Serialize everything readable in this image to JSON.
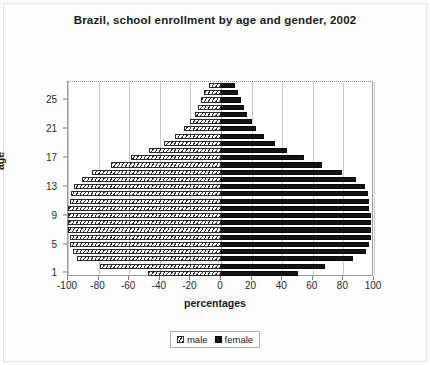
{
  "chart_data": {
    "type": "bar",
    "subtype": "population-pyramid",
    "title": "Brazil, school enrollment by age and gender, 2002",
    "xlabel": "percentages",
    "ylabel": "age",
    "xlim": [
      -100,
      100
    ],
    "xticks": [
      -100,
      -80,
      -60,
      -40,
      -20,
      0,
      20,
      40,
      60,
      80,
      100
    ],
    "xticklabels": [
      "-100",
      "-80",
      "-60",
      "-40",
      "-20",
      "0",
      "20",
      "40",
      "60",
      "80",
      "100"
    ],
    "ylim": [
      0,
      28
    ],
    "yticks": [
      1,
      5,
      9,
      13,
      17,
      21,
      25
    ],
    "yticklabels": [
      "1",
      "5",
      "9",
      "13",
      "17",
      "21",
      "25"
    ],
    "grid": "vertical",
    "legend_position": "bottom-center",
    "categories": [
      1,
      2,
      3,
      4,
      5,
      6,
      7,
      8,
      9,
      10,
      11,
      12,
      13,
      14,
      15,
      16,
      17,
      18,
      19,
      20,
      21,
      22,
      23,
      24,
      25,
      26,
      27
    ],
    "series": [
      {
        "name": "male",
        "pattern": "hatched",
        "color": "#ffffff",
        "sign": "negative",
        "values": [
          -48,
          -79,
          -94,
          -97,
          -99,
          -99,
          -100,
          -100,
          -100,
          -100,
          -99,
          -98,
          -96,
          -91,
          -84,
          -72,
          -59,
          -47,
          -37,
          -30,
          -24,
          -20,
          -17,
          -15,
          -13,
          -11,
          -8
        ]
      },
      {
        "name": "female",
        "pattern": "solid",
        "color": "#141414",
        "sign": "positive",
        "values": [
          50,
          68,
          86,
          95,
          97,
          98,
          98,
          98,
          98,
          97,
          97,
          96,
          94,
          88,
          79,
          66,
          54,
          43,
          35,
          28,
          23,
          20,
          17,
          15,
          13,
          11,
          9
        ]
      }
    ]
  },
  "legend": {
    "items": [
      {
        "label": "male"
      },
      {
        "label": "female"
      }
    ]
  }
}
